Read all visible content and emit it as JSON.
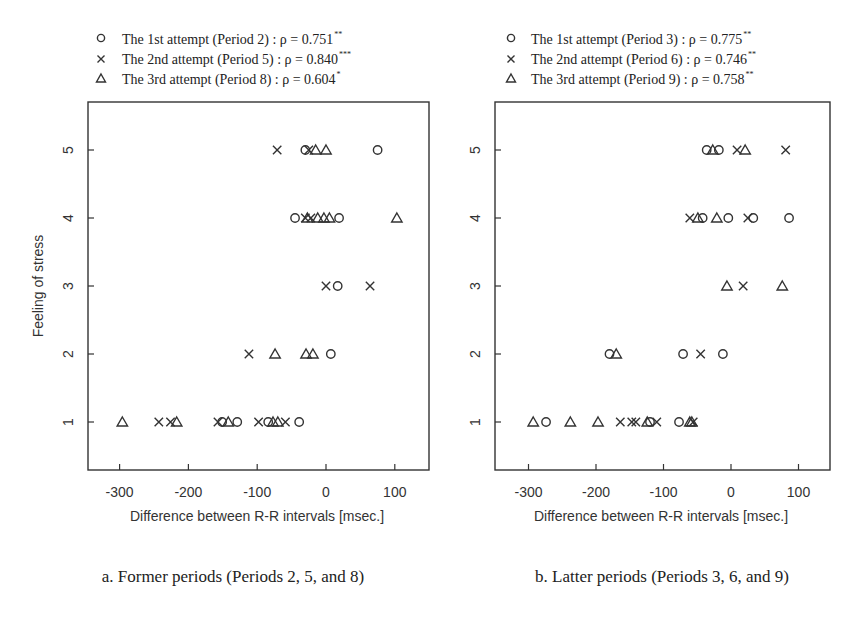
{
  "chart_data": [
    {
      "type": "scatter",
      "caption": "a. Former periods (Periods 2, 5, and 8)",
      "xlabel": "Difference between R-R intervals [msec.]",
      "ylabel": "Feeling of stress",
      "xlim": [
        -340,
        150
      ],
      "ylim": [
        0.3,
        5.7
      ],
      "xticks": [
        -300,
        -200,
        -100,
        0,
        100
      ],
      "yticks": [
        1,
        2,
        3,
        4,
        5
      ],
      "grid": false,
      "legend_position": "top",
      "series": [
        {
          "name": "The 1st attempt (Period 2)",
          "marker": "circle",
          "rho_label": "ρ = 0.751",
          "significance": "**",
          "points": [
            [
              -30,
              5
            ],
            [
              75,
              5
            ],
            [
              -45,
              4
            ],
            [
              19,
              4
            ],
            [
              17,
              3
            ],
            [
              7,
              2
            ],
            [
              -151,
              1
            ],
            [
              -129,
              1
            ],
            [
              -84,
              1
            ],
            [
              -39,
              1
            ]
          ]
        },
        {
          "name": "The 2nd attempt (Period 5)",
          "marker": "cross",
          "rho_label": "ρ = 0.840",
          "significance": "***",
          "points": [
            [
              -71,
              5
            ],
            [
              -25,
              5
            ],
            [
              -30,
              4
            ],
            [
              -22,
              4
            ],
            [
              0,
              3
            ],
            [
              64,
              3
            ],
            [
              -112,
              2
            ],
            [
              -243,
              1
            ],
            [
              -226,
              1
            ],
            [
              -157,
              1
            ],
            [
              -98,
              1
            ],
            [
              -59,
              1
            ]
          ]
        },
        {
          "name": "The 3rd attempt (Period 8)",
          "marker": "triangle",
          "rho_label": "ρ = 0.604",
          "significance": "*",
          "points": [
            [
              -15,
              5
            ],
            [
              0,
              5
            ],
            [
              -27,
              4
            ],
            [
              -12,
              4
            ],
            [
              -3,
              4
            ],
            [
              5,
              4
            ],
            [
              103,
              4
            ],
            [
              -74,
              2
            ],
            [
              -29,
              2
            ],
            [
              -19,
              2
            ],
            [
              -296,
              1
            ],
            [
              -217,
              1
            ],
            [
              -142,
              1
            ],
            [
              -77,
              1
            ],
            [
              -70,
              1
            ]
          ]
        }
      ]
    },
    {
      "type": "scatter",
      "caption": "b. Latter periods (Periods 3, 6, and 9)",
      "xlabel": "Difference between R-R intervals [msec.]",
      "ylabel": "",
      "xlim": [
        -350,
        145
      ],
      "ylim": [
        0.3,
        5.7
      ],
      "xticks": [
        -300,
        -200,
        -100,
        0,
        100
      ],
      "yticks": [
        1,
        2,
        3,
        4,
        5
      ],
      "grid": false,
      "legend_position": "top",
      "series": [
        {
          "name": "The 1st attempt (Period 3)",
          "marker": "circle",
          "rho_label": "ρ = 0.775",
          "significance": "**",
          "points": [
            [
              -36,
              5
            ],
            [
              -18,
              5
            ],
            [
              -42,
              4
            ],
            [
              -4,
              4
            ],
            [
              33,
              4
            ],
            [
              86,
              4
            ],
            [
              -180,
              2
            ],
            [
              -71,
              2
            ],
            [
              -12,
              2
            ],
            [
              -274,
              1
            ],
            [
              -120,
              1
            ],
            [
              -77,
              1
            ]
          ]
        },
        {
          "name": "The 2nd attempt (Period 6)",
          "marker": "cross",
          "rho_label": "ρ = 0.746",
          "significance": "**",
          "points": [
            [
              9,
              5
            ],
            [
              81,
              5
            ],
            [
              -61,
              4
            ],
            [
              25,
              4
            ],
            [
              18,
              3
            ],
            [
              -45,
              2
            ],
            [
              -164,
              1
            ],
            [
              -147,
              1
            ],
            [
              -141,
              1
            ],
            [
              -110,
              1
            ],
            [
              -56,
              1
            ]
          ]
        },
        {
          "name": "The 3rd attempt (Period 9)",
          "marker": "triangle",
          "rho_label": "ρ = 0.758",
          "significance": "**",
          "points": [
            [
              -27,
              5
            ],
            [
              21,
              5
            ],
            [
              -49,
              4
            ],
            [
              -21,
              4
            ],
            [
              -6,
              3
            ],
            [
              76,
              3
            ],
            [
              -170,
              2
            ],
            [
              -293,
              1
            ],
            [
              -238,
              1
            ],
            [
              -197,
              1
            ],
            [
              -124,
              1
            ],
            [
              -61,
              1
            ],
            [
              -58,
              1
            ]
          ]
        }
      ]
    }
  ],
  "panels": [
    {
      "legend": [
        {
          "marker": "circle",
          "text": "The 1st attempt  (Period 2)  : ρ = 0.751",
          "sup": "**"
        },
        {
          "marker": "cross",
          "text": "The 2nd attempt (Period 5) : ρ = 0.840",
          "sup": "***"
        },
        {
          "marker": "triangle",
          "text": "The 3rd attempt (Period 8)  : ρ = 0.604",
          "sup": "*"
        }
      ],
      "xlabel": "Difference between R-R intervals [msec.]",
      "ylabel": "Feeling of stress",
      "caption": "a. Former periods (Periods 2, 5, and 8)",
      "xtick_labels": [
        "-300",
        "-200",
        "-100",
        "0",
        "100"
      ],
      "ytick_labels": [
        "1",
        "2",
        "3",
        "4",
        "5"
      ]
    },
    {
      "legend": [
        {
          "marker": "circle",
          "text": "The 1st attempt  (Period 3) : ρ = 0.775",
          "sup": "**"
        },
        {
          "marker": "cross",
          "text": "The 2nd attempt (Period 6) : ρ = 0.746",
          "sup": "**"
        },
        {
          "marker": "triangle",
          "text": "The 3rd attempt  (Period 9) : ρ = 0.758",
          "sup": "**"
        }
      ],
      "xlabel": "Difference between R-R intervals [msec.]",
      "ylabel": "",
      "caption": "b. Latter periods (Periods 3, 6, and 9)",
      "xtick_labels": [
        "-300",
        "-200",
        "-100",
        "0",
        "100"
      ],
      "ytick_labels": [
        "1",
        "2",
        "3",
        "4",
        "5"
      ]
    }
  ],
  "colors": {
    "ink": "#333333",
    "background": "#ffffff"
  }
}
